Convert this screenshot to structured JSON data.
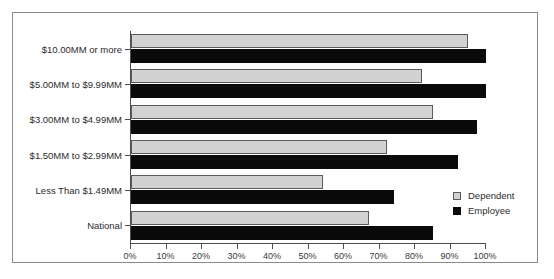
{
  "chart_data": {
    "type": "bar",
    "orientation": "horizontal",
    "title": "",
    "xlabel": "",
    "ylabel": "",
    "xlim": [
      0,
      100
    ],
    "grid": false,
    "legend_position": "center-right",
    "categories": [
      "$10.00MM or more",
      "$5.00MM to $9.99MM",
      "$3.00MM to $4.99MM",
      "$1.50MM to $2.99MM",
      "Less Than $1.49MM",
      "National"
    ],
    "tick_labels": [
      "0%",
      "10%",
      "20%",
      "30%",
      "40%",
      "50%",
      "60%",
      "70%",
      "80%",
      "90%",
      "100%"
    ],
    "tick_values": [
      0,
      10,
      20,
      30,
      40,
      50,
      60,
      70,
      80,
      90,
      100
    ],
    "series": [
      {
        "name": "Dependent",
        "color": "#d2d2d2",
        "values": [
          95,
          82,
          85,
          72,
          54,
          67
        ]
      },
      {
        "name": "Employee",
        "color": "#0a0a0a",
        "values": [
          100,
          100,
          97.5,
          92,
          74,
          85
        ]
      }
    ]
  },
  "legend": {
    "items": [
      {
        "label": "Dependent"
      },
      {
        "label": "Employee"
      }
    ]
  }
}
